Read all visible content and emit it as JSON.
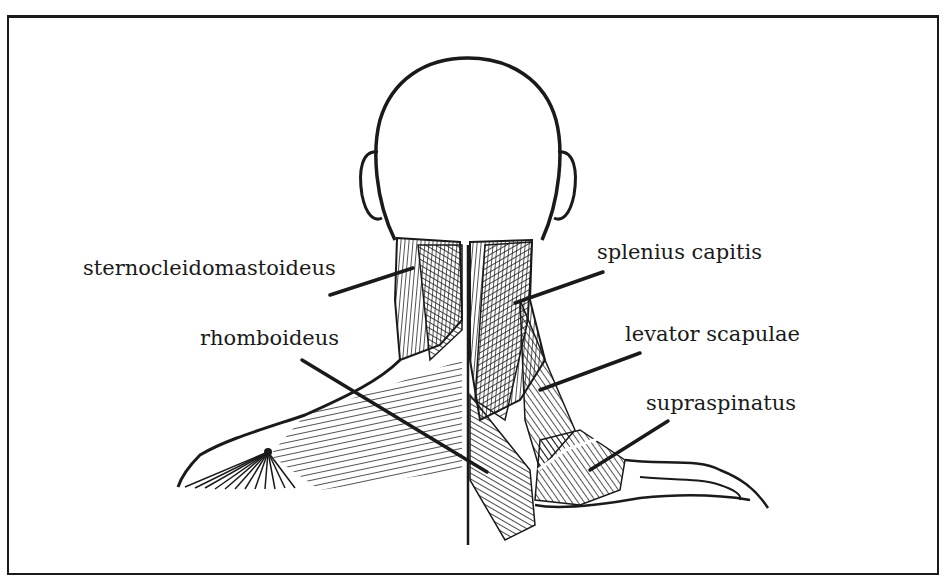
{
  "figure": {
    "labels": [
      {
        "id": "sternocleidomastoideus",
        "text": "sternocleidomastoideus",
        "side": "left"
      },
      {
        "id": "rhomboideus",
        "text": "rhomboideus",
        "side": "left"
      },
      {
        "id": "splenius-capitis",
        "text": "splenius capitis",
        "side": "right"
      },
      {
        "id": "levator-scapulae",
        "text": "levator scapulae",
        "side": "right"
      },
      {
        "id": "supraspinatus",
        "text": "supraspinatus",
        "side": "right"
      }
    ]
  },
  "colors": {
    "ink": "#1a1a1a",
    "paper": "#ffffff"
  }
}
